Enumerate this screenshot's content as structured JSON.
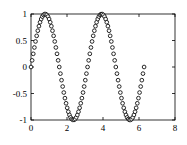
{
  "chart_data": {
    "type": "scatter",
    "title": "",
    "subtitle": "",
    "xlabel": "",
    "ylabel": "",
    "xlim": [
      0,
      8
    ],
    "ylim": [
      -1,
      1
    ],
    "grid": false,
    "legend": null,
    "legend_position": "none",
    "marker": "open-circle",
    "marker_face_color": "#ffffff",
    "marker_edge_color": "#111111",
    "box": true,
    "xticks": [
      0,
      2,
      4,
      6,
      8
    ],
    "xtick_labels": [
      "0",
      "2",
      "4",
      "6",
      "8"
    ],
    "yticks": [
      -1,
      -0.5,
      0,
      0.5,
      1
    ],
    "ytick_labels": [
      "-1",
      "-0.5",
      "0",
      "0.5",
      "1"
    ],
    "x": [
      0,
      0.0628,
      0.1257,
      0.1885,
      0.2513,
      0.3142,
      0.377,
      0.4398,
      0.5027,
      0.5655,
      0.6283,
      0.6912,
      0.754,
      0.8168,
      0.8796,
      0.9425,
      1.0053,
      1.0681,
      1.131,
      1.1938,
      1.2566,
      1.3195,
      1.3823,
      1.4451,
      1.508,
      1.5708,
      1.6336,
      1.6965,
      1.7593,
      1.8221,
      1.885,
      1.9478,
      2.0106,
      2.0735,
      2.1363,
      2.1991,
      2.2619,
      2.3248,
      2.3876,
      2.4504,
      2.5133,
      2.5761,
      2.6389,
      2.7018,
      2.7646,
      2.8274,
      2.8903,
      2.9531,
      3.0159,
      3.0788,
      3.1416,
      3.2044,
      3.2673,
      3.3301,
      3.3929,
      3.4558,
      3.5186,
      3.5814,
      3.6442,
      3.7071,
      3.7699,
      3.8327,
      3.8956,
      3.9584,
      4.0212,
      4.0841,
      4.1469,
      4.2097,
      4.2726,
      4.3354,
      4.3982,
      4.4611,
      4.5239,
      4.5867,
      4.6496,
      4.7124,
      4.7752,
      4.838,
      4.9009,
      4.9637,
      5.0265,
      5.0894,
      5.1522,
      5.215,
      5.2779,
      5.3407,
      5.4035,
      5.4664,
      5.5292,
      5.592,
      5.6549,
      5.7177,
      5.7805,
      5.8434,
      5.9062,
      5.969,
      6.0319,
      6.0947,
      6.1575,
      6.2204,
      6.2832
    ],
    "y": [
      0,
      0.1253,
      0.2487,
      0.3681,
      0.4818,
      0.5878,
      0.6845,
      0.7705,
      0.8443,
      0.905,
      0.9511,
      0.9823,
      0.998,
      0.998,
      0.9823,
      0.9511,
      0.905,
      0.8443,
      0.7705,
      0.6845,
      0.5878,
      0.4818,
      0.3681,
      0.2487,
      0.1253,
      0,
      -0.1253,
      -0.2487,
      -0.3681,
      -0.4818,
      -0.5878,
      -0.6845,
      -0.7705,
      -0.8443,
      -0.905,
      -0.9511,
      -0.9823,
      -0.998,
      -0.998,
      -0.9823,
      -0.9511,
      -0.905,
      -0.8443,
      -0.7705,
      -0.6845,
      -0.5878,
      -0.4818,
      -0.3681,
      -0.2487,
      -0.1253,
      0,
      0.1253,
      0.2487,
      0.3681,
      0.4818,
      0.5878,
      0.6845,
      0.7705,
      0.8443,
      0.905,
      0.9511,
      0.9823,
      0.998,
      0.998,
      0.9823,
      0.9511,
      0.905,
      0.8443,
      0.7705,
      0.6845,
      0.5878,
      0.4818,
      0.3681,
      0.2487,
      0.1253,
      0,
      -0.1253,
      -0.2487,
      -0.3681,
      -0.4818,
      -0.5878,
      -0.6845,
      -0.7705,
      -0.8443,
      -0.905,
      -0.9511,
      -0.9823,
      -0.998,
      -0.998,
      -0.9823,
      -0.9511,
      -0.905,
      -0.8443,
      -0.7705,
      -0.6845,
      -0.5878,
      -0.4818,
      -0.3681,
      -0.2487,
      -0.1253,
      0
    ]
  }
}
